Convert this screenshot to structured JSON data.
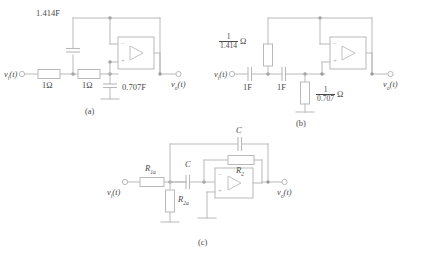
{
  "figure": {
    "wire_color": "#b9b9bb",
    "text_color": "#4a4a4a",
    "background": "#ffffff"
  },
  "circuits": [
    {
      "id": "a",
      "caption": "(a)",
      "input_label": "v",
      "input_sub": "i",
      "input_arg": "(t)",
      "output_label": "v",
      "output_sub": "o",
      "output_arg": "(t)",
      "components": [
        {
          "name": "capacitor-shunt-top",
          "label": "1.414F",
          "type": "capacitor"
        },
        {
          "name": "resistor-series-1",
          "label": "1Ω",
          "type": "resistor"
        },
        {
          "name": "resistor-series-2",
          "label": "1Ω",
          "type": "resistor"
        },
        {
          "name": "capacitor-shunt-ground",
          "label": "0.707F",
          "type": "capacitor"
        }
      ],
      "opamp": {
        "minus": "−",
        "plus": "+"
      }
    },
    {
      "id": "b",
      "caption": "(b)",
      "input_label": "v",
      "input_sub": "i",
      "input_arg": "(t)",
      "output_label": "v",
      "output_sub": "o",
      "output_arg": "(t)",
      "components": [
        {
          "name": "resistor-feedback",
          "numerator": "1",
          "denominator": "1.414",
          "unit": "Ω",
          "type": "resistor-fraction"
        },
        {
          "name": "capacitor-series-1",
          "label": "1F",
          "type": "capacitor"
        },
        {
          "name": "capacitor-series-2",
          "label": "1F",
          "type": "capacitor"
        },
        {
          "name": "resistor-shunt-ground",
          "numerator": "1",
          "denominator": "0.707",
          "unit": "Ω",
          "type": "resistor-fraction"
        }
      ],
      "opamp": {
        "minus": "−",
        "plus": "+"
      }
    },
    {
      "id": "c",
      "caption": "(c)",
      "input_label": "v",
      "input_sub": "i",
      "input_arg": "(t)",
      "output_label": "v",
      "output_sub": "o",
      "output_arg": "(t)",
      "components": [
        {
          "name": "capacitor-feedback-top",
          "label": "C",
          "sub": "",
          "type": "capacitor"
        },
        {
          "name": "resistor-input",
          "label": "R",
          "sub": "1a",
          "type": "resistor"
        },
        {
          "name": "resistor-shunt",
          "label": "R",
          "sub": "2a",
          "type": "resistor"
        },
        {
          "name": "capacitor-series",
          "label": "C",
          "sub": "",
          "type": "capacitor"
        },
        {
          "name": "resistor-feedback",
          "label": "R",
          "sub": "2",
          "type": "resistor"
        }
      ],
      "opamp": {
        "minus": "−",
        "plus": "+"
      }
    }
  ]
}
